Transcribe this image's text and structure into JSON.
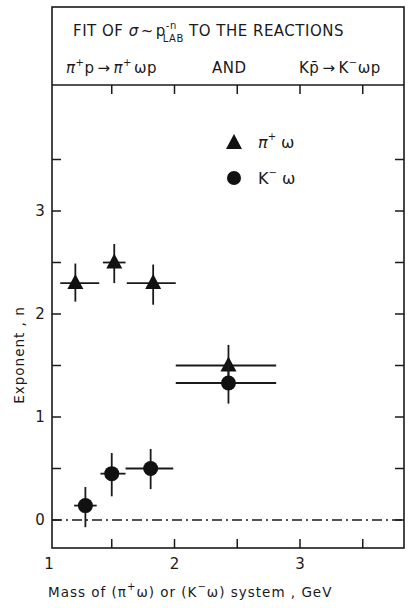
{
  "header": {
    "line1_prefix": "FIT OF ",
    "line1_sigma": "σ",
    "line1_tilde": "~",
    "line1_p": "p",
    "line1_p_sup": "-n",
    "line1_p_sub": "LAB",
    "line1_suffix": " TO THE REACTIONS",
    "reaction1": {
      "pi": "π",
      "plus": "+",
      "p": "p",
      "arrow": "→",
      "pi2": "π",
      "plus2": "+",
      "omega_p": "ωp"
    },
    "and_label": "AND",
    "reaction2": {
      "K": "K",
      "pbar": "p̄",
      "arrow": "→",
      "K2": "K",
      "minus": "−",
      "omega_p": "ωp"
    }
  },
  "chart_data": {
    "type": "scatter",
    "xlabel": "Mass of (π+ω) or (K-ω) system , GeV",
    "ylabel": "Exponent , n",
    "xlim": [
      1.0,
      3.83
    ],
    "ylim": [
      -0.27,
      4.2
    ],
    "x_ticks": [
      1,
      1.5,
      2,
      2.5,
      3,
      3.5
    ],
    "x_tick_labels": [
      {
        "value": 1,
        "label": "1"
      },
      {
        "value": 2,
        "label": "2"
      },
      {
        "value": 3,
        "label": "3"
      }
    ],
    "y_ticks": [
      0,
      0.5,
      1,
      1.5,
      2,
      2.5,
      3,
      3.5
    ],
    "y_tick_labels": [
      {
        "value": 0,
        "label": "0"
      },
      {
        "value": 1,
        "label": "1"
      },
      {
        "value": 2,
        "label": "2"
      },
      {
        "value": 3,
        "label": "3"
      }
    ],
    "grid": false,
    "reference_line": {
      "y": 0,
      "style": "dash-dot"
    },
    "legend_position": "upper right (inside plot)",
    "series": [
      {
        "name": "π+ω",
        "marker": "triangle",
        "points": [
          {
            "x": 1.21,
            "y": 2.3,
            "xerr": [
              1.09,
              1.4
            ],
            "yerr": [
              2.12,
              2.49
            ]
          },
          {
            "x": 1.52,
            "y": 2.5,
            "xerr": [
              1.43,
              1.61
            ],
            "yerr": [
              2.3,
              2.68
            ]
          },
          {
            "x": 1.83,
            "y": 2.3,
            "xerr": [
              1.62,
              2.01
            ],
            "yerr": [
              2.09,
              2.48
            ]
          },
          {
            "x": 2.43,
            "y": 1.5,
            "xerr": [
              2.01,
              2.81
            ],
            "yerr": [
              1.29,
              1.7
            ]
          }
        ]
      },
      {
        "name": "K-ω",
        "marker": "circle",
        "points": [
          {
            "x": 1.29,
            "y": 0.14,
            "xerr": [
              1.2,
              1.38
            ],
            "yerr": [
              -0.07,
              0.32
            ]
          },
          {
            "x": 1.5,
            "y": 0.45,
            "xerr": [
              1.41,
              1.61
            ],
            "yerr": [
              0.23,
              0.65
            ]
          },
          {
            "x": 1.81,
            "y": 0.5,
            "xerr": [
              1.61,
              1.99
            ],
            "yerr": [
              0.3,
              0.69
            ]
          },
          {
            "x": 2.43,
            "y": 1.33,
            "xerr": [
              2.01,
              2.81
            ],
            "yerr": [
              1.13,
              1.53
            ]
          }
        ]
      }
    ]
  },
  "legend": {
    "items": [
      {
        "symbol": "triangle",
        "base": "π",
        "sup": "+",
        "tail": " ω"
      },
      {
        "symbol": "circle",
        "base": "K",
        "sup": "−",
        "tail": " ω"
      }
    ]
  },
  "axes": {
    "ylabel": "Exponent , n",
    "xlabel_parts": {
      "a": "Mass of  (π",
      "a_sup": "+",
      "b": "ω)  or  (K",
      "b_sup": "−",
      "c": "ω)  system , GeV"
    }
  },
  "colors": {
    "ink": "#1a1a1a",
    "background": "#ffffff"
  }
}
